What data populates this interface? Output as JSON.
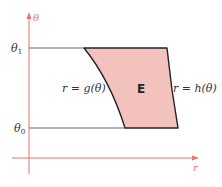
{
  "diagram": {
    "axes": {
      "vertical_label": "θ",
      "horizontal_label": "r",
      "axis_color": "#e8736b"
    },
    "ticks": {
      "theta1": {
        "symbol": "θ",
        "subscript": "1"
      },
      "theta0": {
        "symbol": "θ",
        "subscript": "0"
      }
    },
    "region": {
      "label": "E",
      "fill_color": "#f4c2bd",
      "stroke_color": "#222222"
    },
    "curves": {
      "left": "r = g(θ)",
      "right": "r = h(θ)"
    }
  }
}
